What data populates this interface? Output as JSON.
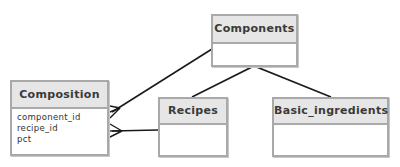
{
  "diagram": {
    "type": "entity-relationship",
    "style": "hand-drawn",
    "colors": {
      "box_border": "#a9a9a9",
      "header_fill": "#e6e6e6",
      "line": "#1a1a1a",
      "text": "#3a3a3a"
    },
    "entities": [
      {
        "id": "components",
        "name": "Components",
        "fields": []
      },
      {
        "id": "composition",
        "name": "Composition",
        "fields": [
          "component_id",
          "recipe_id",
          "pct"
        ]
      },
      {
        "id": "recipes",
        "name": "Recipes",
        "fields": []
      },
      {
        "id": "basic_ingredients",
        "name": "Basic_ingredients",
        "fields": []
      }
    ],
    "relationships": [
      {
        "from": "composition",
        "to": "components",
        "from_end": "many",
        "to_end": "one"
      },
      {
        "from": "composition",
        "to": "recipes",
        "from_end": "many",
        "to_end": "one"
      },
      {
        "from": "components",
        "to": "recipes",
        "type": "generalization"
      },
      {
        "from": "components",
        "to": "basic_ingredients",
        "type": "generalization"
      }
    ]
  }
}
